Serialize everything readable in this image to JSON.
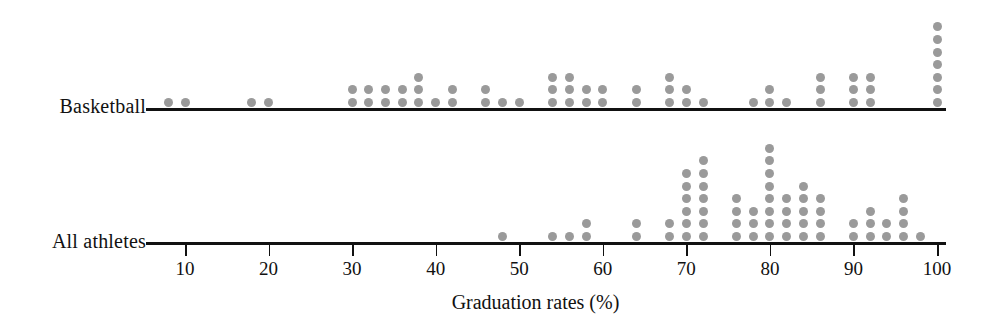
{
  "chart_data": {
    "type": "scatter",
    "plot_style": "dot-plot",
    "title": "",
    "xlabel": "Graduation rates (%)",
    "ylabel": "",
    "xlim": [
      5,
      102
    ],
    "xticks": [
      10,
      20,
      30,
      40,
      50,
      60,
      70,
      80,
      90,
      100
    ],
    "xtick_labels": [
      "10",
      "20",
      "30",
      "40",
      "50",
      "60",
      "70",
      "80",
      "90",
      "100"
    ],
    "grid": false,
    "legend": "none",
    "dot_color": "#9a9a9a",
    "axis_color": "#111111",
    "series": [
      {
        "name": "Basketball",
        "x": [
          8,
          10,
          18,
          20,
          30,
          32,
          34,
          36,
          38,
          40,
          42,
          46,
          48,
          50,
          54,
          56,
          58,
          60,
          64,
          68,
          70,
          72,
          78,
          80,
          82,
          86,
          90,
          92,
          100
        ],
        "counts": [
          1,
          1,
          1,
          1,
          2,
          2,
          2,
          2,
          3,
          1,
          2,
          2,
          1,
          1,
          3,
          3,
          2,
          2,
          2,
          3,
          2,
          1,
          1,
          2,
          1,
          3,
          3,
          3,
          7
        ],
        "total": 58
      },
      {
        "name": "All athletes",
        "x": [
          48,
          54,
          56,
          58,
          64,
          68,
          70,
          72,
          76,
          78,
          80,
          82,
          84,
          86,
          90,
          92,
          94,
          96,
          98
        ],
        "counts": [
          1,
          1,
          1,
          2,
          2,
          2,
          6,
          7,
          4,
          3,
          8,
          4,
          5,
          4,
          2,
          3,
          2,
          4,
          1
        ],
        "total": 62
      }
    ]
  },
  "labels": {
    "row_basketball": "Basketball",
    "row_all_athletes": "All athletes",
    "axis_title": "Graduation rates (%)"
  }
}
